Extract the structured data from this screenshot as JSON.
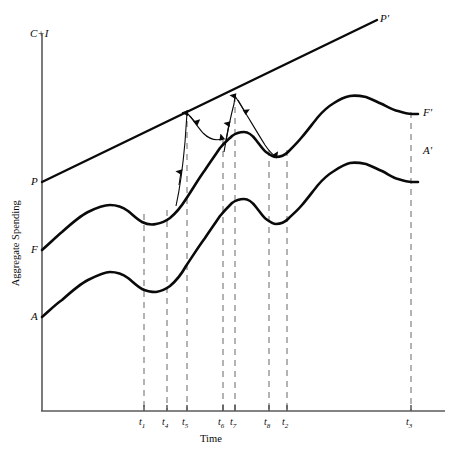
{
  "chart_data": {
    "type": "line",
    "title": "",
    "xlabel": "Time",
    "ylabel": "Aggregate Spending",
    "axis_top_label": "C+I",
    "grid": false,
    "legend": "none",
    "xlim": [
      0,
      1
    ],
    "ylim": [
      0,
      1
    ],
    "tick_labels": [
      "t1",
      "t4",
      "t5",
      "t6",
      "t7",
      "t8",
      "t2",
      "t3"
    ],
    "tick_subscripts": [
      "1",
      "4",
      "5",
      "6",
      "7",
      "8",
      "2",
      "3"
    ],
    "tick_base": "t",
    "tick_x_px": [
      144,
      167,
      187,
      223,
      235,
      269,
      287,
      411
    ],
    "vertical_dashed_lines_count": 8,
    "series": [
      {
        "name": "P",
        "start_label": "P",
        "end_label": "P'",
        "description": "Potential output straight rising line from P to P prime",
        "style": "solid-straight",
        "points_px": [
          [
            42,
            182
          ],
          [
            377,
            20
          ]
        ]
      },
      {
        "name": "F",
        "start_label": "F",
        "end_label": "F'",
        "description": "Full-employment / frictional spending wavy curve",
        "style": "solid-curve",
        "points_px": [
          [
            42,
            250
          ],
          [
            62,
            232
          ],
          [
            88,
            212
          ],
          [
            110,
            205
          ],
          [
            128,
            211
          ],
          [
            142,
            222
          ],
          [
            156,
            224
          ],
          [
            170,
            218
          ],
          [
            186,
            199
          ],
          [
            205,
            170
          ],
          [
            220,
            148
          ],
          [
            232,
            136
          ],
          [
            244,
            132
          ],
          [
            256,
            140
          ],
          [
            266,
            152
          ],
          [
            276,
            157
          ],
          [
            288,
            152
          ],
          [
            302,
            137
          ],
          [
            318,
            117
          ],
          [
            334,
            103
          ],
          [
            350,
            96
          ],
          [
            366,
            97
          ],
          [
            382,
            104
          ],
          [
            398,
            111
          ],
          [
            412,
            114
          ],
          [
            418,
            114
          ]
        ]
      },
      {
        "name": "A",
        "start_label": "A",
        "end_label": "A'",
        "description": "Actual spending wavy curve, parallel below F",
        "style": "solid-curve",
        "points_px": [
          [
            42,
            317
          ],
          [
            62,
            300
          ],
          [
            88,
            280
          ],
          [
            110,
            272
          ],
          [
            128,
            278
          ],
          [
            142,
            289
          ],
          [
            156,
            292
          ],
          [
            170,
            286
          ],
          [
            186,
            266
          ],
          [
            205,
            238
          ],
          [
            220,
            216
          ],
          [
            232,
            203
          ],
          [
            244,
            199
          ],
          [
            256,
            207
          ],
          [
            266,
            219
          ],
          [
            276,
            224
          ],
          [
            288,
            219
          ],
          [
            302,
            205
          ],
          [
            318,
            185
          ],
          [
            334,
            171
          ],
          [
            350,
            163
          ],
          [
            366,
            164
          ],
          [
            382,
            171
          ],
          [
            398,
            179
          ],
          [
            412,
            182
          ],
          [
            418,
            182
          ]
        ]
      }
    ],
    "annotations": [
      {
        "name": "first-upward-adjustment-arrow",
        "type": "arrow-curve",
        "direction": "up",
        "description": "Arrow rising from F curve near t4 up to the P line at t5",
        "points_px": [
          [
            178,
            200
          ],
          [
            182,
            170
          ],
          [
            185,
            140
          ],
          [
            187,
            113
          ]
        ]
      },
      {
        "name": "first-downward-adjustment-arrow",
        "type": "arrow-curve",
        "direction": "down-right",
        "description": "Arrow descending from the P line at t5 curving down to rejoin the F curve near t6",
        "points_px": [
          [
            187,
            113
          ],
          [
            195,
            120
          ],
          [
            203,
            133
          ],
          [
            212,
            140
          ],
          [
            222,
            139
          ]
        ]
      },
      {
        "name": "second-upward-adjustment-arrow",
        "type": "arrow-curve",
        "direction": "up",
        "description": "Arrow rising from F curve near t6 up to the P line at t7",
        "points_px": [
          [
            226,
            148
          ],
          [
            230,
            126
          ],
          [
            233,
            110
          ],
          [
            235,
            99
          ]
        ]
      },
      {
        "name": "second-downward-adjustment-arrow",
        "type": "arrow-curve",
        "direction": "down-right",
        "description": "Arrow descending from the P line at t7 down to rejoin the F curve near t8",
        "points_px": [
          [
            235,
            99
          ],
          [
            245,
            112
          ],
          [
            256,
            130
          ],
          [
            266,
            146
          ],
          [
            274,
            155
          ]
        ]
      }
    ],
    "colors": {
      "line": "#0a0a0a",
      "axis": "#4a4a4a",
      "dashed_guide": "#9a9a9a",
      "background": "#ffffff"
    }
  },
  "labels": {
    "y_axis_top": "C+I",
    "y_axis_title": "Aggregate Spending",
    "x_axis_title": "Time",
    "p_start": "P",
    "p_end": "P'",
    "f_start": "F",
    "f_end": "F'",
    "a_start": "A",
    "a_end": "A'"
  },
  "ticks": [
    {
      "label": "t",
      "sub": "1",
      "x": 144
    },
    {
      "label": "t",
      "sub": "4",
      "x": 167
    },
    {
      "label": "t",
      "sub": "5",
      "x": 187
    },
    {
      "label": "t",
      "sub": "6",
      "x": 223
    },
    {
      "label": "t",
      "sub": "7",
      "x": 235
    },
    {
      "label": "t",
      "sub": "8",
      "x": 269
    },
    {
      "label": "t",
      "sub": "2",
      "x": 287
    },
    {
      "label": "t",
      "sub": "3",
      "x": 411
    }
  ]
}
